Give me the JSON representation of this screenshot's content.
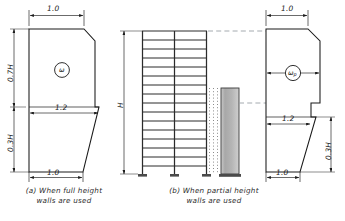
{
  "figure": {
    "kind": "structural-engineering-diagram"
  },
  "panel_a": {
    "caption": "(a) When full height\nwalls are used",
    "top_width_label": "1.0",
    "bottom_width_label": "1.0",
    "mid_width_label": "1.2",
    "upper_height_label": "0.7H",
    "lower_height_label": "0.3H",
    "symbol": "ω",
    "symbol_name": "omega"
  },
  "panel_b": {
    "caption": "(b) When partial height\nwalls are used",
    "frame_height_label": "H",
    "top_width_label": "1.0",
    "bottom_width_label": "1.0",
    "mid_width_label": "1.2",
    "lower_height_label": "0.3H",
    "symbol": "ω",
    "symbol_subscript": "p",
    "symbol_name": "omega-p",
    "frame": {
      "stories": 16,
      "bays": 2,
      "column_lines": 3,
      "partial_wall": "shear wall block at right, partial height",
      "dotted_column": "dotted infill column line"
    }
  },
  "colors": {
    "line": "#1a1a1a",
    "dash": "#9aa0a6",
    "wall_fill": "#b9b9b9",
    "wall_fill_light": "#d8d8d8",
    "background": "#ffffff"
  }
}
